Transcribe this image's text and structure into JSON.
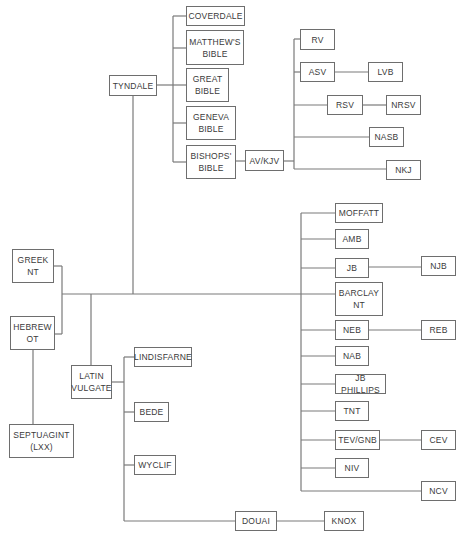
{
  "diagram": {
    "type": "family-tree",
    "nodes": [
      {
        "id": "coverdale",
        "label": "COVERDALE",
        "x": 186,
        "y": 6,
        "w": 59,
        "h": 20
      },
      {
        "id": "matthews",
        "label": "MATTHEW'S\nBIBLE",
        "x": 186,
        "y": 30,
        "w": 58,
        "h": 35
      },
      {
        "id": "tyndale",
        "label": "TYNDALE",
        "x": 109,
        "y": 75,
        "w": 48,
        "h": 21
      },
      {
        "id": "great",
        "label": "GREAT\nBIBLE",
        "x": 186,
        "y": 68,
        "w": 43,
        "h": 34
      },
      {
        "id": "geneva",
        "label": "GENEVA\nBIBLE",
        "x": 186,
        "y": 106,
        "w": 50,
        "h": 34
      },
      {
        "id": "bishops",
        "label": "BISHOPS'\nBIBLE",
        "x": 186,
        "y": 145,
        "w": 50,
        "h": 34
      },
      {
        "id": "avkjv",
        "label": "AV/KJV",
        "x": 245,
        "y": 150,
        "w": 39,
        "h": 21
      },
      {
        "id": "rv",
        "label": "RV",
        "x": 300,
        "y": 29,
        "w": 35,
        "h": 21
      },
      {
        "id": "asv",
        "label": "ASV",
        "x": 300,
        "y": 62,
        "w": 35,
        "h": 20
      },
      {
        "id": "lvb",
        "label": "LVB",
        "x": 368,
        "y": 62,
        "w": 35,
        "h": 20
      },
      {
        "id": "rsv",
        "label": "RSV",
        "x": 327,
        "y": 95,
        "w": 36,
        "h": 20
      },
      {
        "id": "nrsv",
        "label": "NRSV",
        "x": 386,
        "y": 95,
        "w": 35,
        "h": 20
      },
      {
        "id": "nasb",
        "label": "NASB",
        "x": 369,
        "y": 127,
        "w": 35,
        "h": 20
      },
      {
        "id": "nkj",
        "label": "NKJ",
        "x": 386,
        "y": 160,
        "w": 35,
        "h": 20
      },
      {
        "id": "moffatt",
        "label": "MOFFATT",
        "x": 335,
        "y": 203,
        "w": 48,
        "h": 20
      },
      {
        "id": "amb",
        "label": "AMB",
        "x": 335,
        "y": 229,
        "w": 34,
        "h": 20
      },
      {
        "id": "jb",
        "label": "JB",
        "x": 335,
        "y": 258,
        "w": 34,
        "h": 20
      },
      {
        "id": "njb",
        "label": "NJB",
        "x": 421,
        "y": 256,
        "w": 35,
        "h": 20
      },
      {
        "id": "barclay",
        "label": "BARCLAY\nNT",
        "x": 335,
        "y": 282,
        "w": 48,
        "h": 34
      },
      {
        "id": "neb",
        "label": "NEB",
        "x": 335,
        "y": 320,
        "w": 34,
        "h": 20
      },
      {
        "id": "reb",
        "label": "REB",
        "x": 421,
        "y": 320,
        "w": 35,
        "h": 20
      },
      {
        "id": "nab",
        "label": "NAB",
        "x": 335,
        "y": 346,
        "w": 34,
        "h": 20
      },
      {
        "id": "jbphillips",
        "label": "JB PHILLIPS",
        "x": 335,
        "y": 374,
        "w": 51,
        "h": 20
      },
      {
        "id": "tnt",
        "label": "TNT",
        "x": 335,
        "y": 401,
        "w": 34,
        "h": 20
      },
      {
        "id": "tevgnb",
        "label": "TEV/GNB",
        "x": 335,
        "y": 430,
        "w": 45,
        "h": 20
      },
      {
        "id": "cev",
        "label": "CEV",
        "x": 421,
        "y": 430,
        "w": 35,
        "h": 20
      },
      {
        "id": "niv",
        "label": "NIV",
        "x": 335,
        "y": 458,
        "w": 34,
        "h": 20
      },
      {
        "id": "ncv",
        "label": "NCV",
        "x": 421,
        "y": 481,
        "w": 35,
        "h": 20
      },
      {
        "id": "greeknt",
        "label": "GREEK\nNT",
        "x": 12,
        "y": 249,
        "w": 42,
        "h": 34
      },
      {
        "id": "hebrewot",
        "label": "HEBREW\nOT",
        "x": 10,
        "y": 316,
        "w": 45,
        "h": 34
      },
      {
        "id": "latinvulgate",
        "label": "LATIN\nVULGATE",
        "x": 71,
        "y": 365,
        "w": 41,
        "h": 34
      },
      {
        "id": "lindisfarne",
        "label": "LINDISFARNE",
        "x": 134,
        "y": 347,
        "w": 58,
        "h": 20
      },
      {
        "id": "bede",
        "label": "BEDE",
        "x": 134,
        "y": 402,
        "w": 35,
        "h": 20
      },
      {
        "id": "wyclif",
        "label": "WYCLIF",
        "x": 134,
        "y": 455,
        "w": 42,
        "h": 20
      },
      {
        "id": "septuagint",
        "label": "SEPTUAGINT\n(LXX)",
        "x": 9,
        "y": 424,
        "w": 65,
        "h": 34
      },
      {
        "id": "douai",
        "label": "DOUAI",
        "x": 235,
        "y": 511,
        "w": 42,
        "h": 20
      },
      {
        "id": "knox",
        "label": "KNOX",
        "x": 324,
        "y": 511,
        "w": 40,
        "h": 20
      }
    ],
    "edges": [
      [
        "greeknt",
        "trunk"
      ],
      [
        "hebrewot",
        "trunk"
      ],
      [
        "trunk",
        "tyndale"
      ],
      [
        "trunk",
        "latinvulgate"
      ],
      [
        "trunk",
        "modern-group"
      ],
      [
        "hebrewot",
        "septuagint"
      ],
      [
        "tyndale",
        "coverdale"
      ],
      [
        "tyndale",
        "matthews"
      ],
      [
        "tyndale",
        "great"
      ],
      [
        "tyndale",
        "geneva"
      ],
      [
        "tyndale",
        "bishops"
      ],
      [
        "bishops",
        "avkjv"
      ],
      [
        "avkjv",
        "rv"
      ],
      [
        "avkjv",
        "asv"
      ],
      [
        "avkjv",
        "rsv"
      ],
      [
        "avkjv",
        "nasb"
      ],
      [
        "avkjv",
        "nkj"
      ],
      [
        "asv",
        "lvb"
      ],
      [
        "rsv",
        "nrsv"
      ],
      [
        "modern-group",
        "moffatt"
      ],
      [
        "modern-group",
        "amb"
      ],
      [
        "modern-group",
        "jb"
      ],
      [
        "modern-group",
        "barclay"
      ],
      [
        "modern-group",
        "neb"
      ],
      [
        "modern-group",
        "nab"
      ],
      [
        "modern-group",
        "jbphillips"
      ],
      [
        "modern-group",
        "tnt"
      ],
      [
        "modern-group",
        "tevgnb"
      ],
      [
        "modern-group",
        "niv"
      ],
      [
        "modern-group",
        "ncv"
      ],
      [
        "jb",
        "njb"
      ],
      [
        "neb",
        "reb"
      ],
      [
        "tevgnb",
        "cev"
      ],
      [
        "latinvulgate",
        "lindisfarne"
      ],
      [
        "latinvulgate",
        "bede"
      ],
      [
        "latinvulgate",
        "wyclif"
      ],
      [
        "latinvulgate",
        "douai"
      ],
      [
        "douai",
        "knox"
      ]
    ]
  },
  "labels": {
    "coverdale": "COVERDALE",
    "matthews": "MATTHEW'S\nBIBLE",
    "tyndale": "TYNDALE",
    "great": "GREAT\nBIBLE",
    "geneva": "GENEVA\nBIBLE",
    "bishops": "BISHOPS'\nBIBLE",
    "avkjv": "AV/KJV",
    "rv": "RV",
    "asv": "ASV",
    "lvb": "LVB",
    "rsv": "RSV",
    "nrsv": "NRSV",
    "nasb": "NASB",
    "nkj": "NKJ",
    "moffatt": "MOFFATT",
    "amb": "AMB",
    "jb": "JB",
    "njb": "NJB",
    "barclay": "BARCLAY\nNT",
    "neb": "NEB",
    "reb": "REB",
    "nab": "NAB",
    "jbphillips": "JB PHILLIPS",
    "tnt": "TNT",
    "tevgnb": "TEV/GNB",
    "cev": "CEV",
    "niv": "NIV",
    "ncv": "NCV",
    "greeknt": "GREEK\nNT",
    "hebrewot": "HEBREW\nOT",
    "latinvulgate": "LATIN\nVULGATE",
    "lindisfarne": "LINDISFARNE",
    "bede": "BEDE",
    "wyclif": "WYCLIF",
    "septuagint": "SEPTUAGINT\n(LXX)",
    "douai": "DOUAI",
    "knox": "KNOX"
  }
}
